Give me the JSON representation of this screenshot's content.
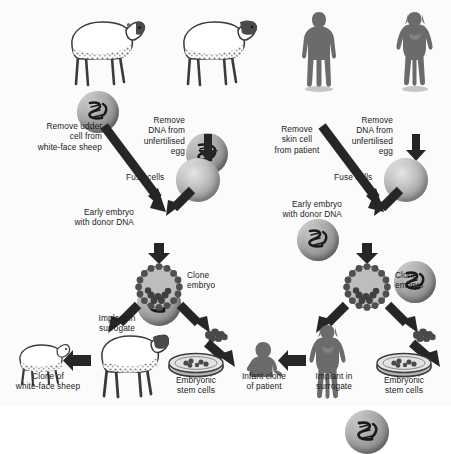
{
  "diagram": {
    "panels": [
      {
        "id": "animal",
        "name": "Animal (sheep) cloning",
        "labels": {
          "donor_cell": "Remove udder\ncell from\nwhite-face sheep",
          "enucleate_egg": "Remove\nDNA from\nunfertilised\negg",
          "fuse": "Fuse cells",
          "early_embryo": "Early embryo\nwith donor DNA",
          "clone_embryo": "Clone\nembryo",
          "implant": "Implant in\nsurrogate",
          "offspring": "Clone of\nwhite-face sheep",
          "stem_cells": "Embryonic\nstem cells"
        },
        "icons": {
          "donor_organism": "sheep-dark-face-icon",
          "egg_donor_organism": "sheep-dark-face-icon",
          "donor_cell": "cell-with-dna-icon",
          "egg_cell": "cell-with-dna-icon",
          "enucleated_egg": "empty-egg-icon",
          "fused_cell": "cell-with-dna-icon",
          "blastocyst": "blastocyst-icon",
          "inner_cell_mass": "inner-cell-mass-icon",
          "surrogate": "sheep-icon",
          "clone": "lamb-icon",
          "dish": "petri-dish-icon"
        }
      },
      {
        "id": "human",
        "name": "Human therapeutic cloning",
        "labels": {
          "donor_cell": "Remove\nskin cell\nfrom patient",
          "enucleate_egg": "Remove\nDNA from\nunfertilised\negg",
          "fuse": "Fuse cells",
          "early_embryo": "Early embryo\nwith donor DNA",
          "clone_embryo": "Clone\nembryo",
          "implant": "Implant in\nsurrogate",
          "offspring": "Infant clone\nof patient",
          "stem_cells": "Embryonic\nstem cells"
        },
        "icons": {
          "donor_organism": "male-silhouette-icon",
          "egg_donor_organism": "female-silhouette-icon",
          "donor_cell": "cell-with-dna-icon",
          "egg_cell": "cell-with-dna-icon",
          "enucleated_egg": "empty-egg-icon",
          "fused_cell": "cell-with-dna-icon",
          "blastocyst": "blastocyst-icon",
          "inner_cell_mass": "inner-cell-mass-icon",
          "surrogate": "female-silhouette-icon",
          "clone": "infant-silhouette-icon",
          "dish": "petri-dish-icon"
        }
      }
    ],
    "colors": {
      "background": "#fbfbfb",
      "text": "#1a1a1a",
      "arrow": "#262626",
      "silhouette": "#6b6b6b",
      "cell_mid": "#a9a9a9",
      "cell_dark": "#6d6d6d",
      "egg_light": "#e6e6e6"
    }
  }
}
